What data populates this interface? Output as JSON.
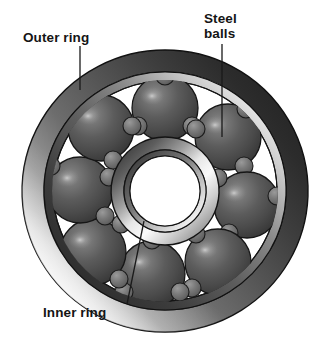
{
  "diagram": {
    "type": "technical-illustration",
    "background_color": "#ffffff"
  },
  "labels": {
    "outer_ring": "Outer ring",
    "steel_balls": "Steel\nballs",
    "inner_ring": "Inner ring"
  },
  "components": {
    "outer_ring": {
      "name": "Outer ring",
      "center_x": 165,
      "center_y": 191,
      "outer_radius_x": 143,
      "outer_radius_y": 141,
      "inner_radius_x": 121,
      "inner_radius_y": 119,
      "race_radius_x": 112,
      "race_radius_y": 110,
      "color_dark": "#2b2b2b",
      "color_mid": "#8f8f8f",
      "color_light": "#f2f2f2"
    },
    "inner_ring": {
      "name": "Inner ring",
      "center_x": 165,
      "center_y": 191,
      "outer_radius": 54,
      "inner_radius": 41,
      "bore_color": "#ffffff",
      "color_dark": "#3a3a3a",
      "color_light": "#f0f0f0"
    },
    "steel_balls": {
      "name": "Steel balls",
      "count": 9,
      "ball_radius": 33,
      "orbit_radius": 83,
      "angles_deg": [
        -70,
        -30,
        10,
        50,
        90,
        130,
        170,
        210,
        250
      ],
      "color_base": "#5a5a5a",
      "color_shadow": "#2f2f2f",
      "color_highlight": "#a8a8a8",
      "nub_radius": 9,
      "nub_color": "#6f6f6f"
    }
  },
  "leaders": {
    "outer_ring": {
      "x1": 80,
      "y1": 46,
      "x2": 80,
      "y2": 90
    },
    "steel_balls": {
      "x1": 222,
      "y1": 44,
      "x2": 222,
      "y2": 137
    },
    "inner_ring": {
      "x1": 127,
      "y1": 304,
      "x2": 144,
      "y2": 221
    },
    "color": "#1a1a1a",
    "width": 1.3
  },
  "colors": {
    "text": "#151515",
    "outline": "#111111",
    "page_background": "#ffffff"
  }
}
